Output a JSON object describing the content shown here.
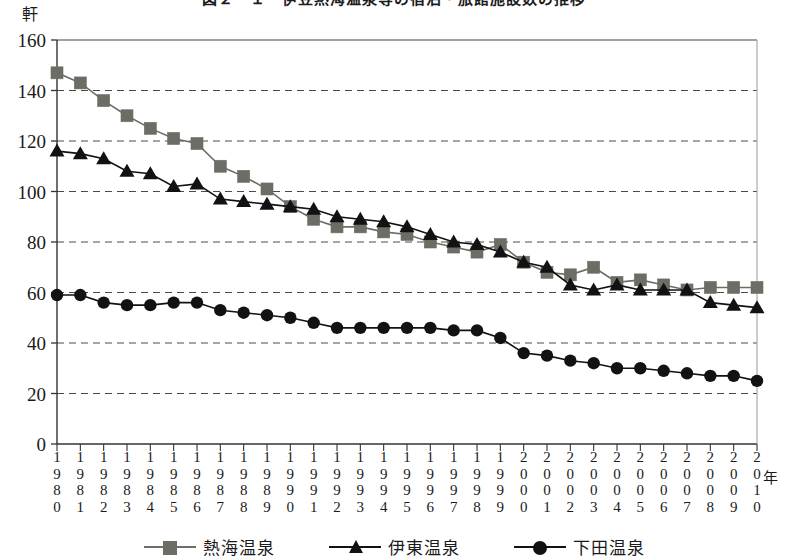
{
  "chart_data": {
    "type": "line",
    "title": "図２－１　伊豆熱海温泉等の宿泊・旅館施設数の推移",
    "xlabel": "年",
    "ylabel": "軒",
    "ylim": [
      0,
      160
    ],
    "ytick_step": 20,
    "yticks": [
      0,
      20,
      40,
      60,
      80,
      100,
      120,
      140,
      160
    ],
    "grid": "horizontal-dashed",
    "legend_position": "bottom",
    "x": [
      1980,
      1981,
      1982,
      1983,
      1984,
      1985,
      1986,
      1987,
      1988,
      1989,
      1990,
      1991,
      1992,
      1993,
      1994,
      1995,
      1996,
      1997,
      1998,
      1999,
      2000,
      2001,
      2002,
      2003,
      2004,
      2005,
      2006,
      2007,
      2008,
      2009,
      2010
    ],
    "categories": [
      "1980",
      "1981",
      "1982",
      "1983",
      "1984",
      "1985",
      "1986",
      "1987",
      "1988",
      "1989",
      "1990",
      "1991",
      "1992",
      "1993",
      "1994",
      "1995",
      "1996",
      "1997",
      "1998",
      "1999",
      "2000",
      "2001",
      "2002",
      "2003",
      "2004",
      "2005",
      "2006",
      "2007",
      "2008",
      "2009",
      "2010"
    ],
    "series": [
      {
        "name": "熱海温泉",
        "marker": "square",
        "color": "#6d6d66",
        "values": [
          147,
          143,
          136,
          130,
          125,
          121,
          119,
          110,
          106,
          101,
          94,
          89,
          86,
          86,
          84,
          83,
          80,
          78,
          76,
          79,
          72,
          68,
          67,
          70,
          64,
          65,
          63,
          61,
          62,
          62,
          62
        ]
      },
      {
        "name": "伊東温泉",
        "marker": "triangle",
        "color": "#121212",
        "values": [
          116,
          115,
          113,
          108,
          107,
          102,
          103,
          97,
          96,
          95,
          94,
          93,
          90,
          89,
          88,
          86,
          83,
          80,
          79,
          76,
          72,
          70,
          63,
          61,
          63,
          61,
          61,
          61,
          56,
          55,
          54
        ]
      },
      {
        "name": "下田温泉",
        "marker": "circle",
        "color": "#121212",
        "values": [
          59,
          59,
          56,
          55,
          55,
          56,
          56,
          53,
          52,
          51,
          50,
          48,
          46,
          46,
          46,
          46,
          46,
          45,
          45,
          42,
          36,
          35,
          33,
          32,
          30,
          30,
          29,
          28,
          27,
          27,
          25
        ]
      }
    ]
  },
  "axis": {
    "y_unit": "軒",
    "x_unit": "年"
  },
  "legend": {
    "items": [
      {
        "label": "熱海温泉",
        "marker": "square-marker-icon",
        "color": "#6d6d66"
      },
      {
        "label": "伊東温泉",
        "marker": "triangle-marker-icon",
        "color": "#121212"
      },
      {
        "label": "下田温泉",
        "marker": "circle-marker-icon",
        "color": "#121212"
      }
    ]
  }
}
